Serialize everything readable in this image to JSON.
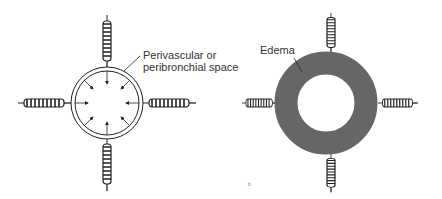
{
  "figure": {
    "left_panel": {
      "label_line1": "Perivascular or",
      "label_line2": "peribronchial space",
      "state": "normal"
    },
    "right_panel": {
      "label": "Edema",
      "state": "edema",
      "ring_color": "#666666"
    },
    "page_mark": "b"
  }
}
